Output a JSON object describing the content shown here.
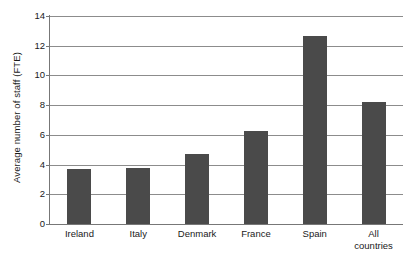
{
  "chart_data": {
    "type": "bar",
    "title": "",
    "xlabel": "",
    "ylabel": "Average number of staff (FTE)",
    "categories": [
      "Ireland",
      "Italy",
      "Denmark",
      "France",
      "Spain",
      "All\ncountries"
    ],
    "values": [
      3.7,
      3.75,
      4.7,
      6.25,
      12.65,
      8.2
    ],
    "ylim": [
      0,
      14
    ],
    "yticks": [
      0,
      2,
      4,
      6,
      8,
      10,
      12,
      14
    ],
    "ytick_labels": [
      "0",
      "2",
      "4",
      "6",
      "8",
      "10",
      "12",
      "14"
    ],
    "grid": true,
    "legend": "none",
    "bar_color": "#4a4a4a",
    "grid_color": "#8c8c8c",
    "axis_color": "#777777",
    "background": "#ffffff"
  },
  "figure": {
    "clipped_title": "",
    "caption": ""
  }
}
